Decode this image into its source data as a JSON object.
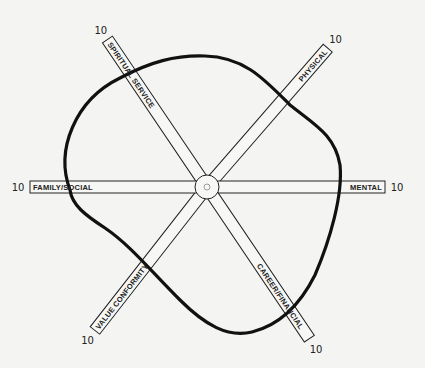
{
  "diagram": {
    "type": "wellness-wheel",
    "center": {
      "x": 207,
      "y": 187
    },
    "hub_radius": 12,
    "spoke_width": 12,
    "max_label": "10",
    "spokes": [
      {
        "id": "spiritual-service",
        "label": "SPIRITUAL SERVICE",
        "angle": -124,
        "length": 178,
        "max": "10"
      },
      {
        "id": "physical",
        "label": "PHYSICAL",
        "angle": -49,
        "length": 184,
        "max": "10"
      },
      {
        "id": "mental",
        "label": "MENTAL",
        "angle": 0,
        "length": 178,
        "max": "10"
      },
      {
        "id": "career-financial",
        "label": "CAREER/FINANCIAL",
        "angle": 56,
        "length": 183,
        "max": "10"
      },
      {
        "id": "value-conformity",
        "label": "VALUE CONFORMITY",
        "angle": 128,
        "length": 182,
        "max": "10"
      },
      {
        "id": "family-social",
        "label": "FAMILY/SOCIAL",
        "angle": 180,
        "length": 177,
        "max": "10"
      }
    ],
    "profile_curve": "closed freehand outline crossing each spoke"
  }
}
